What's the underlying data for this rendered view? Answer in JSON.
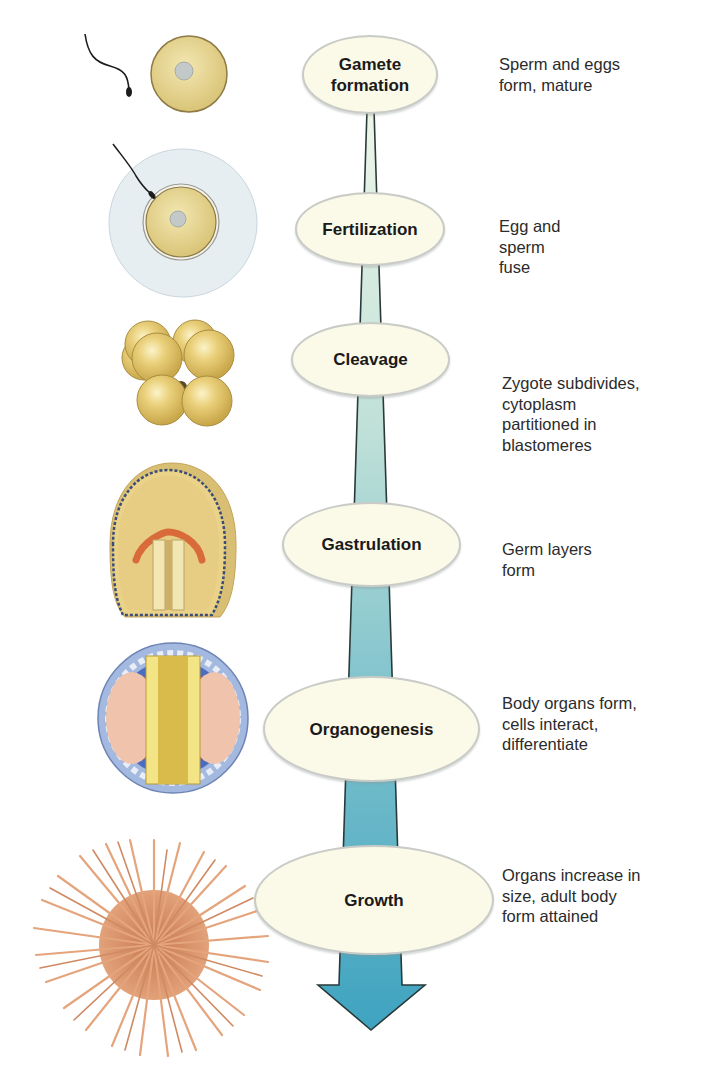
{
  "diagram": {
    "type": "developmental-stages-flow",
    "stages": [
      {
        "label": "Gamete\nformation",
        "description": "Sperm and eggs\nform, mature",
        "illustration": "sperm-and-egg"
      },
      {
        "label": "Fertilization",
        "description": "Egg and\nsperm\nfuse",
        "illustration": "sperm-entering-egg"
      },
      {
        "label": "Cleavage",
        "description": "Zygote subdivides,\ncytoplasm\npartitioned in\nblastomeres",
        "illustration": "eight-cell-embryo"
      },
      {
        "label": "Gastrulation",
        "description": "Germ layers\nform",
        "illustration": "gastrula-section"
      },
      {
        "label": "Organogenesis",
        "description": "Body organs form,\ncells interact,\ndifferentiate",
        "illustration": "neurula-cross-section"
      },
      {
        "label": "Growth",
        "description": "Organs increase in\nsize, adult body\nform attained",
        "illustration": "adult-sea-urchin"
      }
    ],
    "arrow": {
      "direction": "down",
      "color_top": "#e6f2e4",
      "color_bottom": "#3fa3c0"
    },
    "colors": {
      "ellipse_fill": "#fbf9e8",
      "ellipse_border": "#c9ccc6",
      "egg_yolk": "#e6d48a",
      "urchin": "#d9946a"
    }
  }
}
